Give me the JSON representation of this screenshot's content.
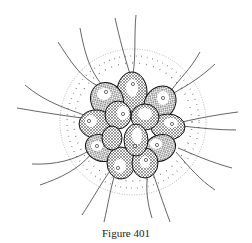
{
  "figure": {
    "caption": "Figure 401",
    "colors": {
      "ink": "#1a1a1a",
      "background": "#ffffff",
      "envelope_dots": "#333333"
    }
  }
}
